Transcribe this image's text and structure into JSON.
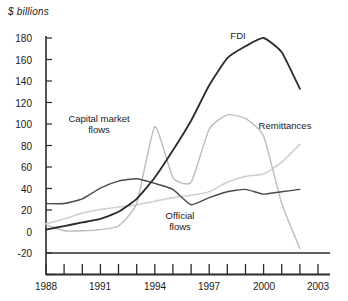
{
  "chart_data": {
    "type": "line",
    "title": "",
    "ylabel": "$ billions",
    "xlabel": "",
    "ylim": [
      -20,
      180
    ],
    "xlim": [
      1988,
      2003
    ],
    "grid": false,
    "legend_position": "inline-annotations",
    "y_ticks": [
      180,
      160,
      140,
      120,
      100,
      80,
      60,
      40,
      20,
      0,
      -20
    ],
    "x_ticks": [
      1988,
      1989,
      1990,
      1991,
      1992,
      1993,
      1994,
      1995,
      1996,
      1997,
      1998,
      1999,
      2000,
      2001,
      2002,
      2003
    ],
    "x_tick_labels": [
      "1988",
      "",
      "",
      "1991",
      "",
      "",
      "1994",
      "",
      "",
      "1997",
      "",
      "",
      "2000",
      "",
      "",
      "2003"
    ],
    "x": [
      1988,
      1989,
      1990,
      1991,
      1992,
      1993,
      1994,
      1995,
      1996,
      1997,
      1998,
      1999,
      2000,
      2001,
      2002
    ],
    "series": [
      {
        "name": "FDI",
        "color": "#2b2b2b",
        "width": 1.8,
        "values": [
          18,
          21,
          24,
          27,
          33,
          44,
          62,
          85,
          110,
          140,
          163,
          173,
          180,
          168,
          137
        ]
      },
      {
        "name": "Capital market flows",
        "color": "#bdbdbd",
        "width": 1.4,
        "values": [
          22,
          17,
          17,
          18,
          21,
          40,
          105,
          62,
          58,
          103,
          115,
          112,
          97,
          40,
          2
        ]
      },
      {
        "name": "Official flows",
        "color": "#4a4a4a",
        "width": 1.4,
        "values": [
          40,
          40,
          44,
          53,
          59,
          61,
          57,
          52,
          39,
          45,
          50,
          52,
          48,
          50,
          52
        ]
      },
      {
        "name": "Remittances",
        "color": "#d0d0d0",
        "width": 1.6,
        "values": [
          23,
          27,
          32,
          35,
          37,
          39,
          42,
          45,
          47,
          50,
          58,
          63,
          65,
          75,
          90
        ]
      }
    ],
    "annotations": [
      {
        "name": "FDI",
        "text": "FDI",
        "x": 238,
        "y": 36
      },
      {
        "name": "Capital market flows",
        "text": "Capital market\nflows",
        "x": 60,
        "y": 113
      },
      {
        "name": "Official flows",
        "text": "Official\nflows",
        "x": 157,
        "y": 212
      },
      {
        "name": "Remittances",
        "text": "Remittances",
        "x": 255,
        "y": 124
      }
    ],
    "zero_line": 0
  },
  "axes": {
    "y_title": "$ billions",
    "y_tick_labels": [
      "180",
      "160",
      "140",
      "120",
      "100",
      "80",
      "60",
      "40",
      "20",
      "0",
      "-20"
    ],
    "x_tick_labels": [
      "1988",
      "1991",
      "1994",
      "1997",
      "2000",
      "2003"
    ]
  },
  "colors": {
    "axis": "#2b2b2b",
    "fdi": "#2b2b2b",
    "capital_market_flows": "#bdbdbd",
    "official_flows": "#4a4a4a",
    "remittances": "#d0d0d0",
    "background": "#ffffff"
  }
}
